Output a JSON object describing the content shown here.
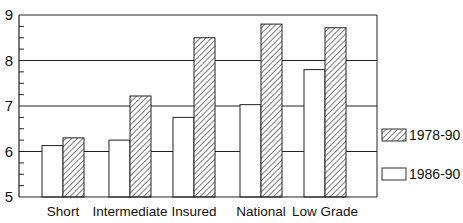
{
  "chart_data": {
    "type": "bar",
    "title": "",
    "xlabel": "",
    "ylabel": "",
    "ylim": [
      5,
      9
    ],
    "yticks": [
      5,
      6,
      7,
      8,
      9
    ],
    "grid": true,
    "legend_position": "right",
    "categories": [
      "Short",
      "Intermediate",
      "Insured",
      "National",
      "Low Grade"
    ],
    "series": [
      {
        "name": "1986-90",
        "pattern": "plain",
        "values": [
          6.13,
          6.25,
          6.75,
          7.03,
          7.8
        ]
      },
      {
        "name": "1978-90",
        "pattern": "hatched",
        "values": [
          6.3,
          7.22,
          8.5,
          8.8,
          8.72
        ]
      }
    ]
  },
  "legend": {
    "hatched_label": "1978-90",
    "plain_label": "1986-90"
  },
  "colors": {
    "axis": "#222222",
    "bar_fill": "#ffffff",
    "hatch": "#333333"
  }
}
